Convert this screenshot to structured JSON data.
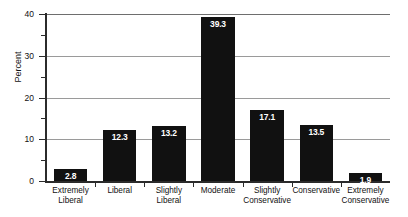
{
  "chart_data": {
    "type": "bar",
    "title": "",
    "xlabel": "",
    "ylabel": "Percent",
    "ylim": [
      0,
      40
    ],
    "ytick_values": [
      0,
      10,
      20,
      30,
      40
    ],
    "ytick_labels": [
      "0",
      "10",
      "20",
      "30",
      "40"
    ],
    "yminor_ticks": [
      5,
      15,
      25,
      35
    ],
    "grid": "horizontal",
    "legend": "none",
    "bar_color": "#111111",
    "value_label_color": "#FFFFFF",
    "categories": [
      "Extremely Liberal",
      "Liberal",
      "Slightly Liberal",
      "Moderate",
      "Slightly Conservative",
      "Conservative",
      "Extremely Conservative"
    ],
    "category_lines": [
      [
        "Extremely",
        "Liberal"
      ],
      [
        "Liberal",
        ""
      ],
      [
        "Slightly",
        "Liberal"
      ],
      [
        "Moderate",
        ""
      ],
      [
        "Slightly",
        "Conservative"
      ],
      [
        "Conservative",
        ""
      ],
      [
        "Extremely",
        "Conservative"
      ]
    ],
    "values": [
      2.8,
      12.3,
      13.2,
      39.3,
      17.1,
      13.5,
      1.9
    ],
    "value_labels": [
      "2.8",
      "12.3",
      "13.2",
      "39.3",
      "17.1",
      "13.5",
      "1.9"
    ]
  }
}
